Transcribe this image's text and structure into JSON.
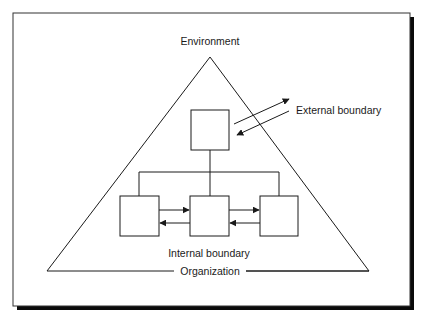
{
  "diagram": {
    "labels": {
      "environment": "Environment",
      "external_boundary": "External boundary",
      "internal_boundary": "Internal boundary",
      "organization": "Organization"
    },
    "nodes": [
      {
        "id": "top",
        "role": "manager"
      },
      {
        "id": "left",
        "role": "unit"
      },
      {
        "id": "middle",
        "role": "unit"
      },
      {
        "id": "right",
        "role": "unit"
      }
    ],
    "edges": [
      {
        "from": "top",
        "to": "environment",
        "type": "arrow",
        "label": "external_boundary"
      },
      {
        "from": "environment",
        "to": "top",
        "type": "arrow",
        "label": "external_boundary"
      },
      {
        "from": "top",
        "to": "left",
        "type": "line"
      },
      {
        "from": "top",
        "to": "middle",
        "type": "line"
      },
      {
        "from": "top",
        "to": "right",
        "type": "line"
      },
      {
        "from": "left",
        "to": "middle",
        "type": "arrow"
      },
      {
        "from": "middle",
        "to": "left",
        "type": "arrow"
      },
      {
        "from": "middle",
        "to": "right",
        "type": "arrow"
      },
      {
        "from": "right",
        "to": "middle",
        "type": "arrow"
      }
    ],
    "colors": {
      "ink": "#1a1a1a",
      "shadow": "#0a0a0a",
      "paper": "#ffffff"
    }
  }
}
